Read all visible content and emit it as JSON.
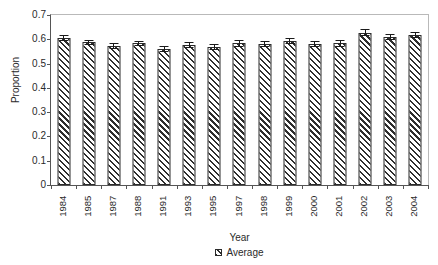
{
  "chart_data": {
    "type": "bar",
    "title": "",
    "subtitle": "",
    "xlabel": "Year",
    "ylabel": "Proportion",
    "categories": [
      "1984",
      "1985",
      "1987",
      "1988",
      "1991",
      "1993",
      "1995",
      "1997",
      "1998",
      "1999",
      "2000",
      "2001",
      "2002",
      "2003",
      "2004"
    ],
    "values": [
      0.605,
      0.588,
      0.572,
      0.583,
      0.56,
      0.578,
      0.568,
      0.583,
      0.58,
      0.592,
      0.582,
      0.583,
      0.627,
      0.608,
      0.617
    ],
    "errors": [
      0.012,
      0.01,
      0.012,
      0.012,
      0.014,
      0.012,
      0.012,
      0.013,
      0.013,
      0.012,
      0.013,
      0.013,
      0.015,
      0.013,
      0.011
    ],
    "series": [
      {
        "name": "Average",
        "values": [
          0.605,
          0.588,
          0.572,
          0.583,
          0.56,
          0.578,
          0.568,
          0.583,
          0.58,
          0.592,
          0.582,
          0.583,
          0.627,
          0.608,
          0.617
        ]
      }
    ],
    "ylim": [
      0,
      0.7
    ],
    "yticks": [
      0,
      0.1,
      0.2,
      0.3,
      0.4,
      0.5,
      0.6,
      0.7
    ],
    "ytick_labels": [
      "0",
      "0.1",
      "0.2",
      "0.3",
      "0.4",
      "0.5",
      "0.6",
      "0.7"
    ],
    "grid": false,
    "legend": {
      "position": "bottom-center",
      "entries": [
        {
          "label": "Average",
          "marker": "hatched-bar-swatch"
        }
      ]
    },
    "error_bars": true,
    "bar_fill": "diagonal-hatch",
    "colors": {
      "bar_outline": "#2b2b2b",
      "bar_hatch": "#2e2e2e",
      "bar_background": "#ffffff",
      "axis": "#555555",
      "frame_light": "#b9b9b9",
      "text": "#2a2a2a",
      "error_bar": "#1a1a1a",
      "plot_background": "#ffffff"
    }
  }
}
